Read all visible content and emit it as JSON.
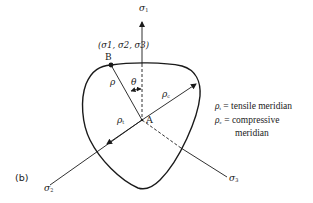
{
  "figure": {
    "panel_label": "(b)",
    "axes": {
      "sigma1": "σ",
      "sigma1_sub": "1",
      "sigma2": "σ",
      "sigma2_sub": "2",
      "sigma3": "σ",
      "sigma3_sub": "3"
    },
    "point_B": {
      "label": "B",
      "coords_label": "(σ1, σ2, σ3)"
    },
    "point_A": {
      "label": "A"
    },
    "rho_label": "ρ",
    "theta_label": "θ",
    "rho_c_label": "ρ",
    "rho_c_sub": "c",
    "rho_t_label": "ρ",
    "rho_t_sub": "t",
    "legend": {
      "line1_symbol": "ρ",
      "line1_sub": "t",
      "line1_text": " = tensile meridian",
      "line2_symbol": "ρ",
      "line2_sub": "c",
      "line2_text": " = compressive",
      "line3_text": "meridian"
    },
    "colors": {
      "stroke": "#1a1a1a",
      "background": "#ffffff"
    }
  }
}
